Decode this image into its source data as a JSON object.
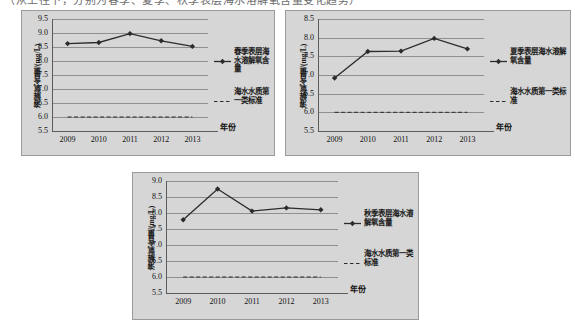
{
  "page": {
    "cut_text": "（从上往下，分别为春季、夏季、秋季表层海水溶解氧含量变化趋势）"
  },
  "charts": [
    {
      "id": "spring",
      "name": "spring-chart",
      "ylabel": "溶解氧含量/(mg/L)",
      "xlabel": "年份",
      "yticks": [
        "9.5",
        "9.0",
        "8.5",
        "8.0",
        "7.5",
        "7.0",
        "6.5",
        "6.0",
        "5.5"
      ],
      "ylim": [
        5.5,
        9.5
      ],
      "categories": [
        "2009",
        "2010",
        "2011",
        "2012",
        "2013"
      ],
      "legend": [
        {
          "label": "春季表层海水溶解氧含量",
          "style": "solid-marker"
        },
        {
          "label": "海水水质第一类标准",
          "style": "dashed"
        }
      ],
      "series": [
        {
          "name": "春季表层海水溶解氧含量",
          "values": [
            8.62,
            8.66,
            8.98,
            8.72,
            8.52
          ]
        },
        {
          "name": "海水水质第一类标准",
          "values": [
            6.0,
            6.0,
            6.0,
            6.0,
            6.0
          ]
        }
      ]
    },
    {
      "id": "summer",
      "name": "summer-chart",
      "ylabel": "溶解氧含量/(mg/L)",
      "xlabel": "年份",
      "yticks": [
        "8.5",
        "8.0",
        "7.5",
        "7.0",
        "6.5",
        "6.0",
        "5.5"
      ],
      "ylim": [
        5.5,
        8.5
      ],
      "categories": [
        "2009",
        "2010",
        "2011",
        "2012",
        "2013"
      ],
      "legend": [
        {
          "label": "夏季表层海水溶解氧含量",
          "style": "solid-marker"
        },
        {
          "label": "海水水质第一类标准",
          "style": "dashed"
        }
      ],
      "series": [
        {
          "name": "夏季表层海水溶解氧含量",
          "values": [
            6.92,
            7.63,
            7.64,
            7.98,
            7.7
          ]
        },
        {
          "name": "海水水质第一类标准",
          "values": [
            6.0,
            6.0,
            6.0,
            6.0,
            6.0
          ]
        }
      ]
    },
    {
      "id": "autumn",
      "name": "autumn-chart",
      "ylabel": "溶解氧含量/(mg/L)",
      "xlabel": "年份",
      "yticks": [
        "9.0",
        "8.5",
        "8.0",
        "7.5",
        "7.0",
        "6.5",
        "6.0",
        "5.5"
      ],
      "ylim": [
        5.5,
        9.0
      ],
      "categories": [
        "2009",
        "2010",
        "2011",
        "2012",
        "2013"
      ],
      "legend": [
        {
          "label": "秋季表层海水溶解氧含量",
          "style": "solid-marker"
        },
        {
          "label": "海水水质第一类标准",
          "style": "dashed"
        }
      ],
      "series": [
        {
          "name": "秋季表层海水溶解氧含量",
          "values": [
            7.79,
            8.75,
            8.06,
            8.16,
            8.1
          ]
        },
        {
          "name": "海水水质第一类标准",
          "values": [
            6.0,
            6.0,
            6.0,
            6.0,
            6.0
          ]
        }
      ]
    }
  ],
  "chart_data": [
    {
      "type": "line",
      "title": "春季表层海水溶解氧含量",
      "xlabel": "年份",
      "ylabel": "溶解氧含量/(mg/L)",
      "categories": [
        "2009",
        "2010",
        "2011",
        "2012",
        "2013"
      ],
      "ylim": [
        5.5,
        9.5
      ],
      "ytick_step": 0.5,
      "grid": true,
      "legend_position": "right",
      "series": [
        {
          "name": "春季表层海水溶解氧含量",
          "values": [
            8.62,
            8.66,
            8.98,
            8.72,
            8.52
          ],
          "style": "solid",
          "marker": "diamond"
        },
        {
          "name": "海水水质第一类标准",
          "values": [
            6.0,
            6.0,
            6.0,
            6.0,
            6.0
          ],
          "style": "dashed",
          "marker": "none"
        }
      ]
    },
    {
      "type": "line",
      "title": "夏季表层海水溶解氧含量",
      "xlabel": "年份",
      "ylabel": "溶解氧含量/(mg/L)",
      "categories": [
        "2009",
        "2010",
        "2011",
        "2012",
        "2013"
      ],
      "ylim": [
        5.5,
        8.5
      ],
      "ytick_step": 0.5,
      "grid": true,
      "legend_position": "right",
      "series": [
        {
          "name": "夏季表层海水溶解氧含量",
          "values": [
            6.92,
            7.63,
            7.64,
            7.98,
            7.7
          ],
          "style": "solid",
          "marker": "diamond"
        },
        {
          "name": "海水水质第一类标准",
          "values": [
            6.0,
            6.0,
            6.0,
            6.0,
            6.0
          ],
          "style": "dashed",
          "marker": "none"
        }
      ]
    },
    {
      "type": "line",
      "title": "秋季表层海水溶解氧含量",
      "xlabel": "年份",
      "ylabel": "溶解氧含量/(mg/L)",
      "categories": [
        "2009",
        "2010",
        "2011",
        "2012",
        "2013"
      ],
      "ylim": [
        5.5,
        9.0
      ],
      "ytick_step": 0.5,
      "grid": true,
      "legend_position": "right",
      "series": [
        {
          "name": "秋季表层海水溶解氧含量",
          "values": [
            7.79,
            8.75,
            8.06,
            8.16,
            8.1
          ],
          "style": "solid",
          "marker": "diamond"
        },
        {
          "name": "海水水质第一类标准",
          "values": [
            6.0,
            6.0,
            6.0,
            6.0,
            6.0
          ],
          "style": "dashed",
          "marker": "none"
        }
      ]
    }
  ],
  "colors": {
    "panel_bg": "#d6d6d6",
    "panel_border": "#9a9a9a",
    "grid": "#8f8f8f",
    "axis": "#5b5b5b",
    "series": "#2b2b2b",
    "text": "#111111"
  }
}
